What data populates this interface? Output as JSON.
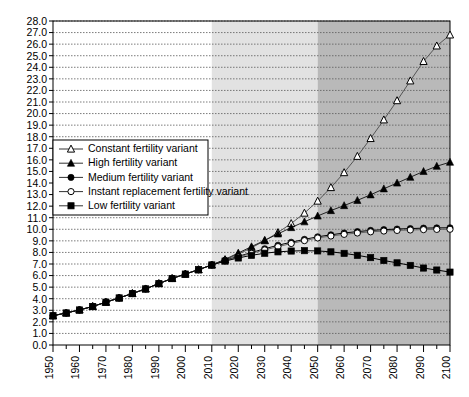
{
  "chart_data": {
    "type": "line",
    "title": "",
    "subtitle": "",
    "xlabel": "",
    "ylabel": "",
    "xlim": [
      1950,
      2100
    ],
    "ylim": [
      0.0,
      28.0
    ],
    "grid": true,
    "y_tick_step": 1.0,
    "x_tick_step": 10,
    "x_minor_tick_step": 5,
    "legend_position": "upper-left-inside",
    "y_tick_labels": [
      "0.0",
      "1.0",
      "2.0",
      "3.0",
      "4.0",
      "5.0",
      "6.0",
      "7.0",
      "8.0",
      "9.0",
      "10.0",
      "11.0",
      "12.0",
      "13.0",
      "14.0",
      "15.0",
      "16.0",
      "17.0",
      "18.0",
      "19.0",
      "20.0",
      "21.0",
      "22.0",
      "23.0",
      "24.0",
      "25.0",
      "26.0",
      "27.0",
      "28.0"
    ],
    "x_tick_labels": [
      "1950",
      "1960",
      "1970",
      "1980",
      "1990",
      "2000",
      "2010",
      "2020",
      "2030",
      "2040",
      "2050",
      "2060",
      "2070",
      "2080",
      "2090",
      "2100"
    ],
    "shaded_regions": [
      {
        "name": "projection-near",
        "from": 2010,
        "to": 2050,
        "color": "#e2e2e2"
      },
      {
        "name": "projection-far",
        "from": 2050,
        "to": 2100,
        "color": "#b9b9b9"
      }
    ],
    "x": [
      1950,
      1955,
      1960,
      1965,
      1970,
      1975,
      1980,
      1985,
      1990,
      1995,
      2000,
      2005,
      2010,
      2015,
      2020,
      2025,
      2030,
      2035,
      2040,
      2045,
      2050,
      2055,
      2060,
      2065,
      2070,
      2075,
      2080,
      2085,
      2090,
      2095,
      2100
    ],
    "series": [
      {
        "name": "Constant fertility variant",
        "marker": "open-triangle",
        "color": "#555555",
        "values": [
          2.53,
          2.77,
          3.03,
          3.33,
          3.7,
          4.07,
          4.45,
          4.85,
          5.31,
          5.75,
          6.13,
          6.51,
          6.92,
          7.35,
          7.85,
          8.4,
          9.02,
          9.72,
          10.5,
          11.4,
          12.44,
          13.61,
          14.9,
          16.31,
          17.85,
          19.46,
          21.12,
          22.83,
          24.51,
          25.85,
          26.8
        ]
      },
      {
        "name": "High fertility variant",
        "marker": "filled-triangle",
        "color": "#222222",
        "values": [
          2.53,
          2.77,
          3.03,
          3.33,
          3.7,
          4.07,
          4.45,
          4.85,
          5.31,
          5.75,
          6.13,
          6.51,
          6.92,
          7.4,
          7.95,
          8.5,
          9.05,
          9.6,
          10.15,
          10.65,
          11.15,
          11.62,
          12.05,
          12.5,
          12.98,
          13.5,
          14.0,
          14.5,
          15.0,
          15.45,
          15.8
        ]
      },
      {
        "name": "Medium fertility variant",
        "marker": "filled-circle",
        "color": "#000000",
        "values": [
          2.53,
          2.77,
          3.03,
          3.33,
          3.7,
          4.07,
          4.45,
          4.85,
          5.31,
          5.75,
          6.13,
          6.51,
          6.92,
          7.32,
          7.66,
          7.99,
          8.32,
          8.62,
          8.88,
          9.13,
          9.35,
          9.52,
          9.68,
          9.8,
          9.9,
          9.97,
          10.02,
          10.06,
          10.1,
          10.12,
          10.13
        ]
      },
      {
        "name": "Instant replacement fertility variant",
        "marker": "open-circle",
        "color": "#666666",
        "values": [
          2.53,
          2.77,
          3.03,
          3.33,
          3.7,
          4.07,
          4.45,
          4.85,
          5.31,
          5.75,
          6.13,
          6.51,
          6.92,
          7.28,
          7.6,
          7.92,
          8.22,
          8.5,
          8.77,
          9.02,
          9.25,
          9.42,
          9.56,
          9.68,
          9.78,
          9.85,
          9.9,
          9.94,
          9.97,
          9.99,
          10.0
        ]
      },
      {
        "name": "Low fertility variant",
        "marker": "filled-square",
        "color": "#000000",
        "values": [
          2.53,
          2.77,
          3.03,
          3.33,
          3.7,
          4.07,
          4.45,
          4.85,
          5.31,
          5.75,
          6.13,
          6.51,
          6.92,
          7.25,
          7.52,
          7.75,
          7.93,
          8.05,
          8.12,
          8.15,
          8.13,
          8.05,
          7.92,
          7.75,
          7.55,
          7.3,
          7.1,
          6.88,
          6.65,
          6.48,
          6.3
        ]
      }
    ]
  },
  "legend": {
    "items": [
      {
        "label": "Constant fertility variant",
        "marker": "open-triangle"
      },
      {
        "label": "High fertility variant",
        "marker": "filled-triangle"
      },
      {
        "label": "Medium fertility variant",
        "marker": "filled-circle"
      },
      {
        "label": "Instant replacement fertility variant",
        "marker": "open-circle"
      },
      {
        "label": "Low fertility variant",
        "marker": "filled-square"
      }
    ]
  },
  "colors": {
    "axis": "#000000",
    "grid": "#5a5a5a",
    "plot_background": "#ffffff",
    "shade_light": "#e2e2e2",
    "shade_dark": "#b9b9b9"
  }
}
